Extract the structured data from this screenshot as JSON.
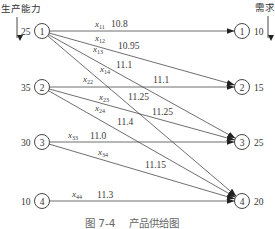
{
  "figure": {
    "supply_heading": "生产能力",
    "demand_heading": "需求",
    "caption_number": "图 7-4",
    "caption_title": "产品供给图"
  },
  "sources": [
    {
      "id": "1",
      "supply": "25"
    },
    {
      "id": "2",
      "supply": "35"
    },
    {
      "id": "3",
      "supply": "30"
    },
    {
      "id": "4",
      "supply": "10"
    }
  ],
  "sinks": [
    {
      "id": "1",
      "demand": "10"
    },
    {
      "id": "2",
      "demand": "15"
    },
    {
      "id": "3",
      "demand": "25"
    },
    {
      "id": "4",
      "demand": "20"
    }
  ],
  "edges": [
    {
      "from": "1",
      "to": "1",
      "var": "x",
      "sub": "11",
      "cost": "10.8"
    },
    {
      "from": "1",
      "to": "2",
      "var": "x",
      "sub": "12",
      "cost": "10.95"
    },
    {
      "from": "1",
      "to": "3",
      "var": "x",
      "sub": "13",
      "cost": "11.1"
    },
    {
      "from": "1",
      "to": "4",
      "var": "x",
      "sub": "14",
      "cost": "11.25"
    },
    {
      "from": "2",
      "to": "2",
      "var": "x",
      "sub": "22",
      "cost": "11.1"
    },
    {
      "from": "2",
      "to": "3",
      "var": "x",
      "sub": "23",
      "cost": "11.25"
    },
    {
      "from": "2",
      "to": "4",
      "var": "x",
      "sub": "24",
      "cost": "11.4"
    },
    {
      "from": "3",
      "to": "3",
      "var": "x",
      "sub": "33",
      "cost": "11.0"
    },
    {
      "from": "3",
      "to": "4",
      "var": "x",
      "sub": "34",
      "cost": "11.15"
    },
    {
      "from": "4",
      "to": "4",
      "var": "x",
      "sub": "44",
      "cost": "11.3"
    }
  ]
}
